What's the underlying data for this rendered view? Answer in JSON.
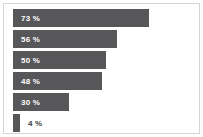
{
  "chart_data": {
    "type": "bar",
    "orientation": "horizontal",
    "title": "",
    "subtitle": "",
    "xlabel": "",
    "ylabel": "",
    "grid": false,
    "legend": null,
    "axis_visible": false,
    "xlim": [
      0,
      100
    ],
    "categories": [
      "",
      "",
      "",
      "",
      "",
      ""
    ],
    "values": [
      73,
      56,
      50,
      48,
      30,
      4
    ],
    "labels": [
      "73 %",
      "56 %",
      "50 %",
      "48 %",
      "30 %",
      "4 %"
    ],
    "label_placement": [
      "inside",
      "inside",
      "inside",
      "inside",
      "inside",
      "outside"
    ],
    "colors": {
      "bar": "#57575a",
      "label_inside": "#ffffff",
      "label_outside": "#3b3b3d",
      "background": "#ffffff",
      "border": "#d4d4d4"
    }
  },
  "bars": [
    {
      "label": "73 %",
      "value": 73
    },
    {
      "label": "56 %",
      "value": 56
    },
    {
      "label": "50 %",
      "value": 50
    },
    {
      "label": "48 %",
      "value": 48
    },
    {
      "label": "30 %",
      "value": 30
    },
    {
      "label": "4 %",
      "value": 4
    }
  ]
}
